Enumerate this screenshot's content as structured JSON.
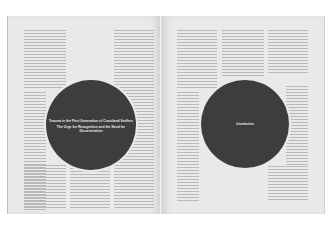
{
  "spread": {
    "left_page": {
      "circle_title_line1": "Trauma in the First Generation of Coastland Settlers",
      "circle_title_line2": "The Urge for Recognition and the Need for Dissemination"
    },
    "right_page": {
      "circle_label": "Introduction"
    }
  },
  "colors": {
    "paper": "#e9e9e7",
    "circle": "#3d3d3d",
    "circle_text": "#e8e8e8",
    "background": "#ffffff"
  }
}
